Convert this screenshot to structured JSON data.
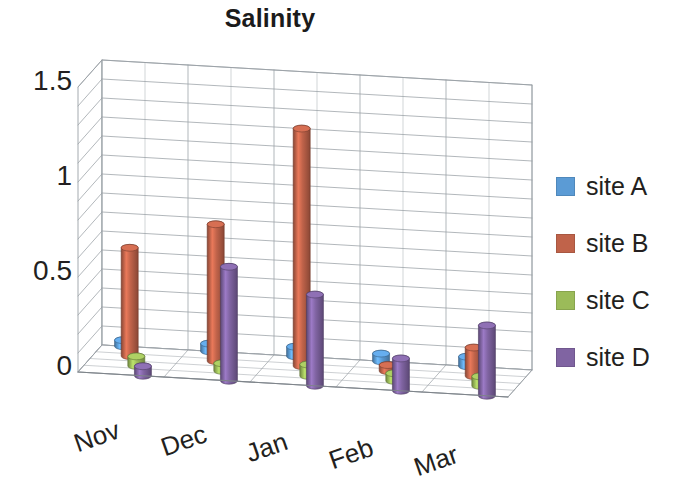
{
  "chart_data": {
    "type": "bar",
    "title": "Salinity",
    "xlabel": "",
    "ylabel": "",
    "categories": [
      "Nov",
      "Dec",
      "Jan",
      "Feb",
      "Mar"
    ],
    "ylim": [
      0,
      1.5
    ],
    "ytick_labels": [
      "0",
      "0.5",
      "1",
      "1.5"
    ],
    "ytick_values": [
      0,
      0.5,
      1,
      1.5
    ],
    "minor_gridline_step": 0.1,
    "grid": true,
    "legend_position": "right",
    "three_d": true,
    "series": [
      {
        "name": "site A",
        "color": "#5b9bd5",
        "values": [
          0.03,
          0.04,
          0.05,
          0.04,
          0.05
        ]
      },
      {
        "name": "site B",
        "color": "#c0634a",
        "values": [
          0.57,
          0.72,
          1.25,
          0.03,
          0.15
        ]
      },
      {
        "name": "site C",
        "color": "#9bbb59",
        "values": [
          0.05,
          0.04,
          0.06,
          0.04,
          0.05
        ]
      },
      {
        "name": "site D",
        "color": "#8064a2",
        "values": [
          0.05,
          0.6,
          0.48,
          0.17,
          0.37
        ]
      }
    ]
  },
  "title": "Salinity",
  "y_axis": {
    "ticks": [
      {
        "label": "1.5"
      },
      {
        "label": "1"
      },
      {
        "label": "0.5"
      },
      {
        "label": "0"
      }
    ]
  },
  "x_axis": {
    "ticks": [
      {
        "label": "Nov"
      },
      {
        "label": "Dec"
      },
      {
        "label": "Jan"
      },
      {
        "label": "Feb"
      },
      {
        "label": "Mar"
      }
    ]
  },
  "legend": {
    "items": [
      {
        "label": "site A",
        "color": "#5b9bd5"
      },
      {
        "label": "site B",
        "color": "#c0634a"
      },
      {
        "label": "site C",
        "color": "#9bbb59"
      },
      {
        "label": "site D",
        "color": "#8064a2"
      }
    ]
  }
}
